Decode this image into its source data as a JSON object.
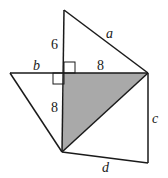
{
  "diagram": {
    "labels": {
      "a": "a",
      "b": "b",
      "c": "c",
      "d": "d",
      "top_segment": "6",
      "right_segment": "8",
      "lower_segment": "8"
    },
    "colors": {
      "stroke": "#1a1a1a",
      "shaded": "#a9a9a9",
      "background": "#ffffff"
    }
  }
}
